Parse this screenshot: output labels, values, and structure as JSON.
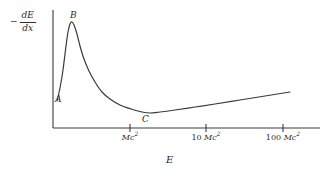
{
  "figure": {
    "background_color": "#ffffff",
    "ink_color": "#3a3a3a",
    "text_color": "#2b2b2b"
  },
  "axis": {
    "y_label": {
      "sign": "−",
      "numerator": "dE",
      "denominator": "dx",
      "full": "− dE/dx"
    },
    "x_label": "E"
  },
  "ticks": [
    {
      "num": "",
      "unit": "Mc",
      "exp": "2",
      "text": "Mc²"
    },
    {
      "num": "10",
      "unit": "Mc",
      "exp": "2",
      "text": "10 Mc²"
    },
    {
      "num": "100",
      "unit": "Mc",
      "exp": "2",
      "text": "100 Mc²"
    }
  ],
  "annotations": [
    {
      "label": "A"
    },
    {
      "label": "B"
    },
    {
      "label": "C"
    }
  ],
  "chart_data": {
    "type": "line",
    "title": "",
    "xlabel": "E",
    "ylabel": "− dE/dx",
    "grid": false,
    "legend": null,
    "x_scale": "log",
    "x_tick_labels": [
      "Mc²",
      "10 Mc²",
      "100 Mc²"
    ],
    "x_tick_positions_px": [
      130,
      206,
      283
    ],
    "y_tick_labels": [],
    "axis_origin_px": [
      53,
      128
    ],
    "axis_x_end_px": 320,
    "axis_y_top_px": 10,
    "annotations": [
      {
        "label": "A",
        "description": "low-energy rise of curve",
        "point_px": [
          59,
          92
        ]
      },
      {
        "label": "B",
        "description": "peak of stopping power",
        "point_px": [
          70,
          22
        ]
      },
      {
        "label": "C",
        "description": "minimum ionizing point",
        "point_px": [
          146,
          113
        ]
      }
    ],
    "series": [
      {
        "name": "-dE/dx",
        "points_px": [
          [
            57,
            101
          ],
          [
            60,
            88
          ],
          [
            63,
            70
          ],
          [
            66,
            46
          ],
          [
            68,
            32
          ],
          [
            70,
            24
          ],
          [
            72,
            22
          ],
          [
            74,
            25
          ],
          [
            77,
            34
          ],
          [
            80,
            46
          ],
          [
            84,
            59
          ],
          [
            89,
            71
          ],
          [
            95,
            82
          ],
          [
            102,
            92
          ],
          [
            110,
            99
          ],
          [
            120,
            105
          ],
          [
            131,
            109
          ],
          [
            142,
            112
          ],
          [
            150,
            113
          ],
          [
            160,
            112
          ],
          [
            175,
            110
          ],
          [
            195,
            107
          ],
          [
            215,
            104
          ],
          [
            240,
            100
          ],
          [
            265,
            96
          ],
          [
            290,
            92
          ]
        ]
      }
    ]
  }
}
